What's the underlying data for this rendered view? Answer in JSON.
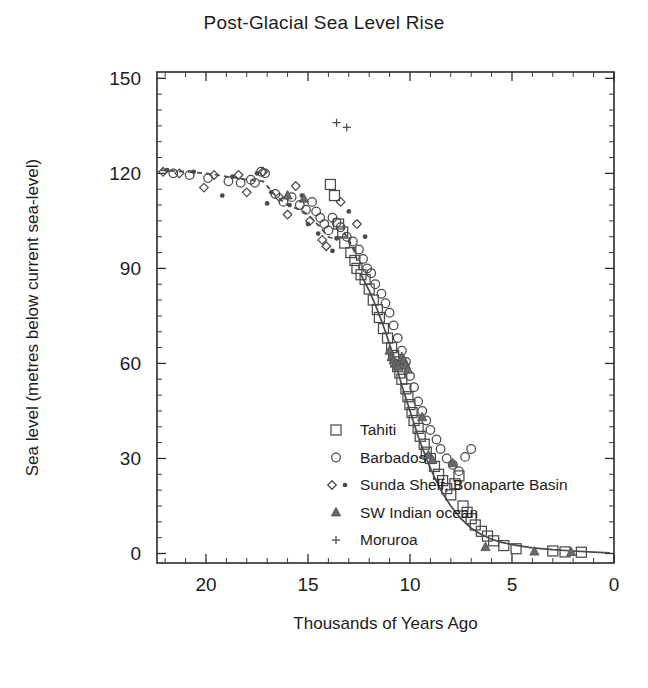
{
  "chart_data": {
    "type": "scatter",
    "title": "Post-Glacial Sea Level Rise",
    "xlabel": "Thousands of Years Ago",
    "ylabel": "Sea level (metres below current sea-level)",
    "xlim": [
      22.4,
      0
    ],
    "ylim": [
      152,
      -3
    ],
    "x_axis_reversed": true,
    "y_axis_inverted": true,
    "grid": false,
    "legend_position": "inside-lower-right",
    "xticks": [
      20,
      15,
      10,
      5,
      0
    ],
    "xtick_labels": [
      "20",
      "15",
      "10",
      "5",
      "0"
    ],
    "yticks": [
      0,
      30,
      60,
      90,
      120,
      150
    ],
    "ytick_labels": [
      "0",
      "30",
      "60",
      "90",
      "120",
      "150"
    ],
    "x_minor_tick_step": 1,
    "y_minor_tick_step": 5,
    "series": [
      {
        "name": "Tahiti",
        "marker": "open-square",
        "points": [
          [
            13.9,
            116.5
          ],
          [
            13.7,
            113.0
          ],
          [
            13.5,
            104.0
          ],
          [
            13.3,
            101.5
          ],
          [
            13.2,
            98.0
          ],
          [
            12.9,
            95.0
          ],
          [
            12.7,
            92.5
          ],
          [
            12.6,
            90.0
          ],
          [
            12.4,
            88.0
          ],
          [
            12.2,
            86.5
          ],
          [
            12.0,
            83.5
          ],
          [
            11.8,
            80.0
          ],
          [
            11.6,
            77.0
          ],
          [
            11.5,
            74.5
          ],
          [
            11.3,
            71.0
          ],
          [
            11.1,
            68.0
          ],
          [
            10.9,
            65.0
          ],
          [
            10.8,
            62.5
          ],
          [
            10.7,
            60.5
          ],
          [
            10.6,
            59.0
          ],
          [
            10.5,
            57.0
          ],
          [
            10.4,
            55.0
          ],
          [
            10.2,
            52.0
          ],
          [
            10.1,
            49.5
          ],
          [
            10.0,
            47.0
          ],
          [
            9.9,
            44.5
          ],
          [
            9.8,
            42.0
          ],
          [
            9.6,
            39.5
          ],
          [
            9.5,
            37.0
          ],
          [
            9.3,
            34.5
          ],
          [
            9.2,
            32.0
          ],
          [
            9.0,
            30.0
          ],
          [
            8.8,
            27.5
          ],
          [
            8.6,
            25.0
          ],
          [
            8.4,
            23.0
          ],
          [
            8.2,
            20.5
          ],
          [
            8.0,
            18.5
          ],
          [
            7.8,
            22.0
          ],
          [
            7.6,
            24.5
          ],
          [
            7.4,
            15.0
          ],
          [
            7.2,
            13.0
          ],
          [
            7.0,
            11.0
          ],
          [
            6.8,
            9.0
          ],
          [
            6.5,
            7.0
          ],
          [
            6.2,
            5.5
          ],
          [
            5.9,
            4.0
          ],
          [
            5.4,
            2.5
          ],
          [
            4.8,
            1.5
          ],
          [
            3.0,
            0.8
          ],
          [
            2.4,
            0.5
          ],
          [
            1.6,
            0.4
          ]
        ]
      },
      {
        "name": "Barbados",
        "marker": "open-circle",
        "points": [
          [
            21.6,
            120.0
          ],
          [
            20.8,
            119.5
          ],
          [
            19.9,
            118.5
          ],
          [
            18.9,
            117.5
          ],
          [
            18.3,
            117.0
          ],
          [
            17.8,
            118.0
          ],
          [
            17.6,
            117.0
          ],
          [
            17.3,
            120.5
          ],
          [
            17.1,
            120.0
          ],
          [
            16.6,
            113.5
          ],
          [
            16.2,
            111.0
          ],
          [
            15.8,
            112.5
          ],
          [
            15.4,
            110.0
          ],
          [
            15.1,
            108.5
          ],
          [
            14.8,
            111.0
          ],
          [
            14.6,
            108.0
          ],
          [
            14.4,
            106.0
          ],
          [
            14.2,
            104.0
          ],
          [
            14.0,
            102.0
          ],
          [
            13.8,
            106.0
          ],
          [
            13.6,
            104.5
          ],
          [
            13.4,
            103.0
          ],
          [
            13.1,
            100.0
          ],
          [
            12.8,
            98.5
          ],
          [
            12.5,
            96.0
          ],
          [
            12.3,
            93.0
          ],
          [
            12.1,
            90.0
          ],
          [
            11.9,
            88.5
          ],
          [
            11.7,
            85.0
          ],
          [
            11.4,
            82.0
          ],
          [
            11.2,
            79.0
          ],
          [
            11.0,
            76.0
          ],
          [
            10.8,
            72.0
          ],
          [
            10.6,
            68.0
          ],
          [
            10.4,
            64.0
          ],
          [
            10.2,
            60.5
          ],
          [
            10.0,
            56.0
          ],
          [
            9.8,
            52.5
          ],
          [
            9.6,
            48.0
          ],
          [
            9.4,
            45.0
          ],
          [
            9.2,
            42.0
          ],
          [
            9.0,
            39.0
          ],
          [
            8.7,
            36.0
          ],
          [
            8.5,
            33.0
          ],
          [
            8.2,
            30.0
          ],
          [
            7.9,
            28.0
          ],
          [
            7.6,
            26.0
          ],
          [
            7.3,
            30.5
          ],
          [
            7.0,
            33.0
          ]
        ]
      },
      {
        "name": "Sunda Shelf, Bonaparte Basin",
        "marker": "diamond-and-dot",
        "points": [
          [
            22.1,
            120.5
          ],
          [
            21.9,
            121.0
          ],
          [
            21.3,
            120.0
          ],
          [
            20.6,
            120.5
          ],
          [
            19.6,
            119.5
          ],
          [
            18.7,
            119.0
          ],
          [
            18.4,
            119.5
          ],
          [
            17.5,
            120.0
          ],
          [
            17.2,
            120.5
          ],
          [
            16.8,
            114.0
          ],
          [
            16.4,
            112.5
          ],
          [
            15.9,
            110.0
          ],
          [
            15.6,
            116.0
          ],
          [
            15.3,
            113.0
          ],
          [
            14.9,
            105.0
          ],
          [
            14.5,
            101.0
          ],
          [
            14.1,
            97.0
          ],
          [
            13.8,
            95.5
          ],
          [
            13.4,
            111.0
          ],
          [
            13.0,
            108.0
          ],
          [
            20.1,
            115.5
          ],
          [
            19.2,
            113.0
          ],
          [
            18.0,
            114.0
          ],
          [
            17.0,
            110.5
          ],
          [
            16.0,
            107.0
          ],
          [
            15.0,
            104.0
          ],
          [
            14.3,
            99.0
          ],
          [
            13.6,
            99.5
          ],
          [
            12.6,
            104.0
          ],
          [
            12.2,
            100.0
          ]
        ]
      },
      {
        "name": "SW Indian ocean",
        "marker": "filled-triangle",
        "points": [
          [
            16.0,
            113.0
          ],
          [
            15.2,
            112.0
          ],
          [
            11.0,
            64.0
          ],
          [
            10.9,
            62.0
          ],
          [
            10.8,
            61.0
          ],
          [
            10.7,
            60.0
          ],
          [
            10.6,
            59.0
          ],
          [
            10.5,
            60.5
          ],
          [
            10.4,
            62.0
          ],
          [
            10.3,
            61.0
          ],
          [
            10.2,
            59.5
          ],
          [
            10.1,
            58.0
          ],
          [
            9.4,
            43.0
          ],
          [
            9.1,
            31.0
          ],
          [
            8.9,
            29.5
          ],
          [
            7.9,
            28.5
          ],
          [
            6.3,
            2.0
          ],
          [
            3.9,
            0.6
          ],
          [
            2.1,
            0.4
          ]
        ]
      },
      {
        "name": "Moruroa",
        "marker": "small-plus",
        "points": [
          [
            13.6,
            136.0
          ],
          [
            13.1,
            134.5
          ]
        ]
      }
    ],
    "model_curve": {
      "name": "eustatic sea-level model",
      "solid_from_x": 12.4,
      "style": "solid right of 12.4 ka, dashed left of 12.4 ka",
      "points": [
        [
          22.2,
          121.0
        ],
        [
          21.0,
          120.5
        ],
        [
          20.0,
          120.0
        ],
        [
          19.0,
          119.0
        ],
        [
          18.0,
          118.0
        ],
        [
          17.2,
          117.5
        ],
        [
          16.6,
          113.0
        ],
        [
          16.0,
          110.0
        ],
        [
          15.4,
          108.5
        ],
        [
          15.0,
          107.0
        ],
        [
          14.4,
          103.0
        ],
        [
          14.0,
          100.0
        ],
        [
          13.6,
          99.0
        ],
        [
          13.2,
          101.0
        ],
        [
          13.0,
          99.0
        ],
        [
          12.7,
          95.0
        ],
        [
          12.4,
          88.0
        ],
        [
          12.0,
          83.0
        ],
        [
          11.6,
          77.0
        ],
        [
          11.2,
          70.0
        ],
        [
          10.8,
          62.0
        ],
        [
          10.4,
          53.0
        ],
        [
          10.0,
          45.0
        ],
        [
          9.6,
          37.0
        ],
        [
          9.2,
          30.0
        ],
        [
          8.8,
          24.0
        ],
        [
          8.4,
          19.0
        ],
        [
          8.0,
          15.0
        ],
        [
          7.5,
          11.0
        ],
        [
          7.0,
          8.0
        ],
        [
          6.5,
          6.0
        ],
        [
          6.0,
          4.5
        ],
        [
          5.5,
          3.5
        ],
        [
          5.0,
          2.8
        ],
        [
          4.0,
          1.8
        ],
        [
          3.0,
          1.2
        ],
        [
          2.0,
          0.8
        ],
        [
          1.0,
          0.4
        ],
        [
          0.2,
          0.2
        ]
      ]
    }
  },
  "legend": {
    "items": [
      {
        "label": "Tahiti",
        "marker": "open-square"
      },
      {
        "label": "Barbados",
        "marker": "open-circle"
      },
      {
        "label": "Sunda Shelf, Bonaparte Basin",
        "marker": "diamond-and-dot"
      },
      {
        "label": "SW Indian ocean",
        "marker": "filled-triangle"
      },
      {
        "label": "Moruroa",
        "marker": "small-plus"
      }
    ]
  },
  "colors": {
    "background": "#ffffff",
    "axis": "#2b2b2b",
    "text": "#1c1c1c",
    "marker": "#4a4a4a",
    "curve": "#4a4a4a"
  }
}
